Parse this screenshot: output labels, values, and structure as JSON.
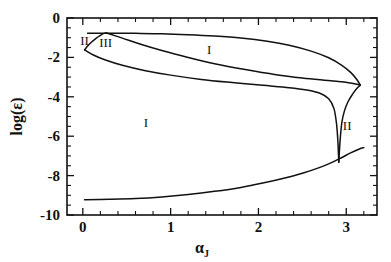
{
  "chart_data": {
    "type": "line",
    "title": "",
    "subtitle": "",
    "xlabel": "α",
    "xlabel_subscript": "J",
    "ylabel": "log(ε)",
    "xlim": [
      -0.18,
      3.35
    ],
    "ylim": [
      -10,
      0
    ],
    "grid": false,
    "legend_position": "none",
    "x_ticks_major": [
      0,
      1,
      2,
      3
    ],
    "x_ticklabels": [
      "0",
      "1",
      "2",
      "3"
    ],
    "x_minor_step": 0.2,
    "y_ticks_major": [
      0,
      -2,
      -4,
      -6,
      -8,
      -10
    ],
    "y_ticklabels": [
      "0",
      "-2",
      "-4",
      "-6",
      "-8",
      "-10"
    ],
    "y_minor_step": 0.5,
    "annotations": [
      {
        "text": "II",
        "x": 0.02,
        "y": -1.35,
        "name": "region-label-II-left"
      },
      {
        "text": "III",
        "x": 0.26,
        "y": -1.45,
        "name": "region-label-III"
      },
      {
        "text": "I",
        "x": 1.44,
        "y": -1.85,
        "name": "region-label-I-upper"
      },
      {
        "text": "I",
        "x": 0.72,
        "y": -5.55,
        "name": "region-label-I-lower"
      },
      {
        "text": "II",
        "x": 3.01,
        "y": -5.7,
        "name": "region-label-II-right"
      }
    ],
    "series": [
      {
        "name": "upper-boundary",
        "comment": "near-horizontal top branch at log(eps) ~ -0.75 bending down to the cusp at alpha~3.16",
        "points": [
          [
            0.055,
            -0.78
          ],
          [
            0.2,
            -0.77
          ],
          [
            0.4,
            -0.77
          ],
          [
            0.6,
            -0.78
          ],
          [
            0.9,
            -0.8
          ],
          [
            1.2,
            -0.85
          ],
          [
            1.5,
            -0.92
          ],
          [
            1.8,
            -1.02
          ],
          [
            2.1,
            -1.18
          ],
          [
            2.35,
            -1.38
          ],
          [
            2.6,
            -1.68
          ],
          [
            2.8,
            -2.02
          ],
          [
            2.95,
            -2.4
          ],
          [
            3.05,
            -2.76
          ],
          [
            3.12,
            -3.12
          ],
          [
            3.16,
            -3.4
          ]
        ]
      },
      {
        "name": "III-cap-left",
        "comment": "small arc rising from alpha=0 up to the apex at alpha~0.24 meeting the top line",
        "points": [
          [
            0.02,
            -1.62
          ],
          [
            0.06,
            -1.4
          ],
          [
            0.1,
            -1.22
          ],
          [
            0.15,
            -1.03
          ],
          [
            0.2,
            -0.88
          ],
          [
            0.24,
            -0.78
          ],
          [
            0.27,
            -0.76
          ]
        ]
      },
      {
        "name": "middle-boundary",
        "comment": "from the apex near alpha~0.27 descending to a long plateau at ~-3.25 then to the cusp",
        "points": [
          [
            0.27,
            -0.76
          ],
          [
            0.45,
            -1.02
          ],
          [
            0.65,
            -1.32
          ],
          [
            0.9,
            -1.65
          ],
          [
            1.2,
            -2.0
          ],
          [
            1.5,
            -2.32
          ],
          [
            1.85,
            -2.62
          ],
          [
            2.2,
            -2.88
          ],
          [
            2.5,
            -3.05
          ],
          [
            2.75,
            -3.16
          ],
          [
            2.95,
            -3.24
          ],
          [
            3.05,
            -3.3
          ],
          [
            3.12,
            -3.36
          ],
          [
            3.16,
            -3.4
          ]
        ]
      },
      {
        "name": "lower-boundary-left",
        "comment": "from alpha=0 at -1.62 sweeping down and right, flattening then plunging into the narrow spike",
        "points": [
          [
            0.02,
            -1.62
          ],
          [
            0.12,
            -1.88
          ],
          [
            0.25,
            -2.12
          ],
          [
            0.45,
            -2.4
          ],
          [
            0.7,
            -2.66
          ],
          [
            1.0,
            -2.9
          ],
          [
            1.35,
            -3.12
          ],
          [
            1.7,
            -3.28
          ],
          [
            2.05,
            -3.42
          ],
          [
            2.35,
            -3.54
          ],
          [
            2.55,
            -3.66
          ],
          [
            2.7,
            -3.82
          ],
          [
            2.8,
            -4.1
          ],
          [
            2.86,
            -4.6
          ],
          [
            2.89,
            -5.4
          ],
          [
            2.905,
            -6.3
          ],
          [
            2.912,
            -7.0
          ],
          [
            2.915,
            -7.32
          ]
        ]
      },
      {
        "name": "spike-right",
        "comment": "right wall of the narrow region II spike, rising from the bottom of the spike to the cusp",
        "points": [
          [
            2.915,
            -7.32
          ],
          [
            2.93,
            -6.2
          ],
          [
            2.95,
            -5.3
          ],
          [
            2.98,
            -4.7
          ],
          [
            3.02,
            -4.25
          ],
          [
            3.07,
            -3.88
          ],
          [
            3.12,
            -3.58
          ],
          [
            3.16,
            -3.4
          ]
        ]
      },
      {
        "name": "bottom-boundary",
        "comment": "lowest curve, flat near -9.2 then rising steeply after alpha~2.5 to about -6.6",
        "points": [
          [
            0.02,
            -9.22
          ],
          [
            0.3,
            -9.2
          ],
          [
            0.6,
            -9.16
          ],
          [
            0.9,
            -9.08
          ],
          [
            1.2,
            -8.96
          ],
          [
            1.5,
            -8.8
          ],
          [
            1.8,
            -8.6
          ],
          [
            2.05,
            -8.38
          ],
          [
            2.3,
            -8.12
          ],
          [
            2.5,
            -7.88
          ],
          [
            2.7,
            -7.58
          ],
          [
            2.85,
            -7.3
          ],
          [
            2.95,
            -7.08
          ],
          [
            3.05,
            -6.85
          ],
          [
            3.15,
            -6.65
          ],
          [
            3.2,
            -6.58
          ]
        ]
      }
    ]
  }
}
